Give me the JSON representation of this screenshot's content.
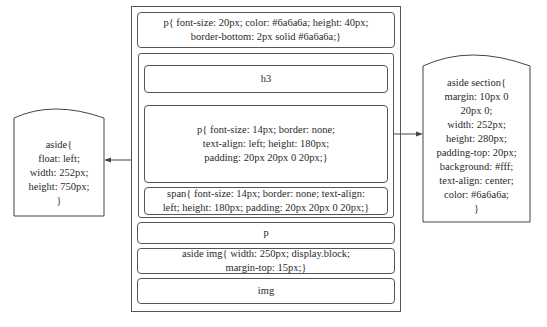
{
  "diagram": {
    "main_column": {
      "header_p": "p{ font-size: 20px; color: #6a6a6a; height: 40px;\nborder-bottom: 2px solid #6a6a6a;}",
      "section": {
        "h3": "h3",
        "p_rule": "p{ font-size: 14px; border: none;\ntext-align: left; height: 180px;\npadding: 20px 20px 0 20px;}",
        "span_rule": "span{ font-size: 14px; border: none; text-align:\nleft; height: 180px; padding: 20px 20px 0 20px;}"
      },
      "p_label": "p",
      "img_rule": "aside img{ width: 250px; display.block;\nmargin-top: 15px;}",
      "img_label": "img"
    },
    "left_aside": "aside{\nfloat: left;\nwidth: 252px;\nheight: 750px;\n}",
    "right_aside_section": "aside section{\nmargin: 10px 0\n20px 0;\nwidth: 252px;\nheight: 280px;\npadding-top: 20px;\nbackground: #fff;\ntext-align: center;\ncolor: #6a6a6a;\n}"
  }
}
